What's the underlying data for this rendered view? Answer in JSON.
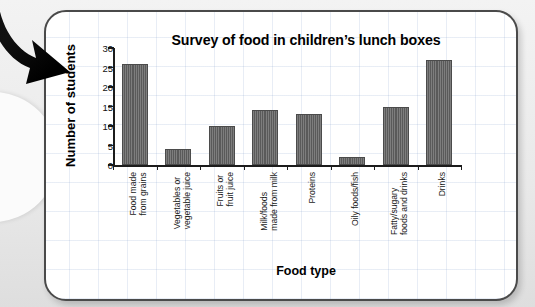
{
  "page": {
    "decoration_arrow": "curved-down-right-arrow"
  },
  "chart_data": {
    "type": "bar",
    "title": "Survey of food in children’s lunch boxes",
    "xlabel": "Food type",
    "ylabel": "Number of students",
    "ylim": [
      0,
      30
    ],
    "yticks": [
      0,
      5,
      10,
      15,
      20,
      25,
      30
    ],
    "ytick_labels": [
      "0",
      "5",
      "10",
      "15",
      "20",
      "25",
      "30"
    ],
    "grid": true,
    "legend": "none",
    "bar_color": "#5a5a5a",
    "categories": [
      "Food made from grains",
      "Vegetables or vegetable juice",
      "Fruits or fruit juice",
      "Milk/foods made from milk",
      "Proteins",
      "Oily foods/fish",
      "Fatty/sugary foods and drinks",
      "Drinks"
    ],
    "category_lines": [
      [
        "Food made",
        "from grains"
      ],
      [
        "Vegetables or",
        "vegetable juice"
      ],
      [
        "Fruits or",
        "fruit juice"
      ],
      [
        "Milk/foods",
        "made from milk"
      ],
      [
        "Proteins"
      ],
      [
        "Oily foods/fish"
      ],
      [
        "Fatty/sugary",
        "foods and drinks"
      ],
      [
        "Drinks"
      ]
    ],
    "values": [
      26,
      4,
      10,
      14,
      13,
      2,
      15,
      27
    ]
  }
}
